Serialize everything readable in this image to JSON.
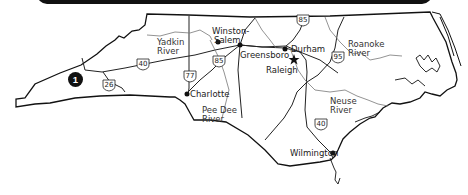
{
  "map": {
    "region_marker": "1",
    "cities": [
      {
        "name": "Winston-\nSalem",
        "line1": "Winston-",
        "line2": "Salem"
      },
      {
        "name": "Greensboro"
      },
      {
        "name": "Durham"
      },
      {
        "name": "Raleigh",
        "capital": true
      },
      {
        "name": "Charlotte"
      },
      {
        "name": "Wilmington"
      }
    ],
    "rivers": [
      {
        "line1": "Yadkin",
        "line2": "River"
      },
      {
        "line1": "Roanoke",
        "line2": "River"
      },
      {
        "line1": "Pee Dee",
        "line2": "River"
      },
      {
        "line1": "Neuse",
        "line2": "River"
      }
    ],
    "highways": [
      "40",
      "26",
      "77",
      "85",
      "85",
      "95",
      "40"
    ],
    "colors": {
      "border": "#111111",
      "river": "#777777",
      "road": "#222222",
      "banner": "#111111"
    }
  }
}
